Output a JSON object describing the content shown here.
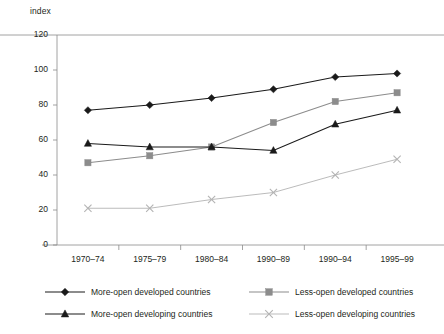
{
  "axis": {
    "y_unit_label": "index",
    "y_ticks": [
      "120",
      "100",
      "80",
      "60",
      "40",
      "20",
      "0"
    ],
    "x_ticks": [
      "1970–74",
      "1975–79",
      "1980–84",
      "1990–89",
      "1990–94",
      "1995–99"
    ]
  },
  "legend": {
    "entries": [
      {
        "label": "More-open developed countries",
        "marker": "diamond-marker",
        "color": "#1a1a1a"
      },
      {
        "label": "Less-open developed countries",
        "marker": "square-marker",
        "color": "#8c8c8c"
      },
      {
        "label": "More-open developing countries",
        "marker": "triangle-marker",
        "color": "#1a1a1a"
      },
      {
        "label": "Less-open developing countries",
        "marker": "cross-marker",
        "color": "#b3b3b3"
      }
    ]
  },
  "chart_data": {
    "type": "line",
    "title": "",
    "xlabel": "",
    "ylabel": "index",
    "ylim": [
      0,
      120
    ],
    "ytick_step": 20,
    "grid": false,
    "legend_position": "bottom",
    "categories": [
      "1970–74",
      "1975–79",
      "1980–84",
      "1990–89",
      "1990–94",
      "1995–99"
    ],
    "series": [
      {
        "name": "More-open developed countries",
        "marker": "diamond",
        "color": "#1a1a1a",
        "values": [
          77,
          80,
          84,
          89,
          96,
          98
        ]
      },
      {
        "name": "Less-open developed countries",
        "marker": "square",
        "color": "#8c8c8c",
        "values": [
          47,
          51,
          56,
          70,
          82,
          87
        ]
      },
      {
        "name": "More-open developing countries",
        "marker": "triangle",
        "color": "#1a1a1a",
        "values": [
          58,
          56,
          56,
          54,
          69,
          77
        ]
      },
      {
        "name": "Less-open developing countries",
        "marker": "cross",
        "color": "#b3b3b3",
        "values": [
          21,
          21,
          26,
          30,
          40,
          49
        ]
      }
    ]
  }
}
